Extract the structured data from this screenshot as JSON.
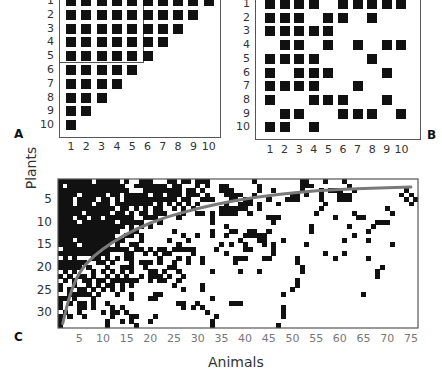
{
  "chart_data": [
    {
      "panel": "A",
      "type": "heatmap",
      "title": "",
      "xlabel": "",
      "ylabel": "",
      "x_ticks": [
        "1",
        "2",
        "3",
        "4",
        "5",
        "6",
        "7",
        "8",
        "9",
        "10"
      ],
      "y_ticks": [
        "1",
        "2",
        "3",
        "4",
        "5",
        "6",
        "7",
        "8",
        "9",
        "10"
      ],
      "description": "Perfectly nested interaction matrix; inner box highlights rows 1-5 x columns 1-5",
      "matrix_rows": [
        [
          1,
          2,
          3,
          4,
          5,
          6,
          7,
          8,
          9,
          10
        ],
        [
          1,
          2,
          3,
          4,
          5,
          6,
          7,
          8,
          9
        ],
        [
          1,
          2,
          3,
          4,
          5,
          6,
          7,
          8
        ],
        [
          1,
          2,
          3,
          4,
          5,
          6,
          7
        ],
        [
          1,
          2,
          3,
          4,
          5,
          6
        ],
        [
          1,
          2,
          3,
          4,
          5
        ],
        [
          1,
          2,
          3,
          4
        ],
        [
          1,
          2,
          3
        ],
        [
          1,
          2
        ],
        [
          1
        ]
      ],
      "highlight_box": {
        "rows": [
          1,
          5
        ],
        "cols": [
          1,
          5
        ]
      }
    },
    {
      "panel": "B",
      "type": "heatmap",
      "title": "",
      "x_ticks": [
        "1",
        "2",
        "3",
        "4",
        "5",
        "6",
        "7",
        "8",
        "9",
        "10"
      ],
      "y_ticks": [
        "1",
        "2",
        "3",
        "4",
        "5",
        "6",
        "7",
        "8",
        "9",
        "10"
      ],
      "description": "Random (non-nested) interaction matrix",
      "matrix_rows": [
        [
          1,
          2,
          3,
          4,
          6,
          7,
          8,
          9,
          10
        ],
        [
          1,
          2,
          3,
          5,
          6,
          8
        ],
        [
          1,
          2,
          3,
          4,
          5
        ],
        [
          2,
          3,
          5,
          7,
          9,
          10
        ],
        [
          1,
          2,
          3,
          4,
          8
        ],
        [
          1,
          3,
          4,
          5,
          9
        ],
        [
          1,
          2,
          3,
          4,
          7
        ],
        [
          1,
          4,
          5,
          6,
          9
        ],
        [
          2,
          3,
          6,
          7,
          8,
          10
        ],
        [
          1,
          2,
          4
        ]
      ]
    },
    {
      "panel": "C",
      "type": "heatmap",
      "xlabel": "Animals",
      "ylabel": "Plants",
      "x_ticks": [
        "5",
        "10",
        "15",
        "20",
        "25",
        "30",
        "35",
        "40",
        "45",
        "50",
        "55",
        "60",
        "65",
        "70",
        "75"
      ],
      "y_ticks": [
        "5",
        "10",
        "15",
        "20",
        "25",
        "30"
      ],
      "n_cols": 76,
      "n_rows": 33,
      "description": "Empirical plant-animal interaction matrix with isocline of perfect nestedness",
      "isocline_color": "#777777",
      "isocline_points": [
        [
          1.5,
          32.5
        ],
        [
          3,
          26
        ],
        [
          5,
          21
        ],
        [
          8,
          17.5
        ],
        [
          12,
          14.5
        ],
        [
          17,
          11.5
        ],
        [
          23,
          9
        ],
        [
          30,
          7
        ],
        [
          38,
          5.2
        ],
        [
          46,
          4
        ],
        [
          55,
          3.1
        ],
        [
          65,
          2.6
        ],
        [
          75,
          2.3
        ]
      ],
      "matrix_rows": [
        [
          1,
          2,
          3,
          4,
          5,
          6,
          7,
          9,
          10,
          11,
          12,
          13,
          15,
          18,
          19,
          20,
          24,
          25,
          27,
          28,
          30,
          31,
          32,
          42,
          52,
          53,
          57,
          61
        ],
        [
          1,
          3,
          4,
          5,
          6,
          7,
          8,
          9,
          10,
          11,
          12,
          13,
          14,
          17,
          18,
          19,
          20,
          21,
          22,
          23,
          25,
          26,
          30,
          32,
          35,
          36,
          43,
          52,
          53,
          54,
          62
        ],
        [
          1,
          2,
          3,
          4,
          5,
          6,
          7,
          8,
          9,
          10,
          11,
          12,
          13,
          14,
          15,
          19,
          20,
          21,
          22,
          23,
          24,
          25,
          26,
          28,
          29,
          31,
          35,
          36,
          37,
          43,
          46,
          52,
          56,
          58,
          59,
          60,
          63,
          74
        ],
        [
          1,
          2,
          3,
          4,
          6,
          7,
          8,
          9,
          10,
          12,
          13,
          15,
          16,
          17,
          18,
          19,
          21,
          22,
          24,
          25,
          26,
          28,
          29,
          30,
          32,
          36,
          37,
          38,
          39,
          42,
          50,
          51,
          53,
          56,
          60,
          61,
          62,
          73,
          75
        ],
        [
          1,
          2,
          3,
          5,
          6,
          7,
          8,
          10,
          11,
          13,
          15,
          16,
          17,
          18,
          19,
          20,
          21,
          22,
          23,
          24,
          25,
          27,
          28,
          31,
          32,
          33,
          37,
          38,
          40,
          41,
          45,
          49,
          50,
          51,
          56,
          60,
          61,
          62,
          74,
          76
        ],
        [
          1,
          2,
          3,
          5,
          6,
          7,
          9,
          10,
          11,
          13,
          14,
          15,
          16,
          17,
          18,
          19,
          20,
          22,
          24,
          26,
          28,
          30,
          36,
          39,
          40,
          41,
          43,
          47,
          57,
          75
        ],
        [
          1,
          2,
          3,
          4,
          5,
          6,
          7,
          8,
          9,
          10,
          11,
          12,
          14,
          15,
          17,
          19,
          21,
          22,
          25,
          27,
          29,
          35,
          36,
          37,
          38,
          39,
          40,
          43,
          56,
          70
        ],
        [
          1,
          2,
          3,
          4,
          5,
          7,
          8,
          9,
          10,
          11,
          13,
          14,
          16,
          18,
          19,
          21,
          22,
          23,
          27,
          30,
          31,
          33,
          35,
          36,
          37,
          38,
          41,
          55,
          63,
          71
        ],
        [
          1,
          2,
          3,
          5,
          6,
          8,
          9,
          11,
          12,
          13,
          14,
          15,
          16,
          19,
          20,
          21,
          26,
          33,
          45,
          46,
          47,
          59,
          64,
          65
        ],
        [
          1,
          2,
          3,
          4,
          6,
          7,
          8,
          9,
          10,
          11,
          12,
          14,
          15,
          16,
          17,
          18,
          22,
          33,
          46,
          68,
          69,
          70
        ],
        [
          1,
          2,
          3,
          4,
          5,
          6,
          7,
          8,
          9,
          10,
          11,
          12,
          13,
          14,
          16,
          18,
          20,
          36,
          54,
          62,
          67
        ],
        [
          1,
          2,
          3,
          4,
          5,
          6,
          7,
          8,
          9,
          10,
          11,
          12,
          13,
          16,
          17,
          25,
          33,
          37,
          38,
          41,
          42,
          45,
          54,
          66
        ],
        [
          1,
          2,
          3,
          4,
          5,
          6,
          7,
          8,
          9,
          10,
          11,
          12,
          15,
          16,
          18,
          27,
          30,
          33,
          36,
          40,
          41,
          42,
          43,
          44,
          63
        ],
        [
          1,
          2,
          3,
          5,
          6,
          7,
          8,
          9,
          10,
          11,
          12,
          13,
          14,
          18,
          24,
          28,
          39,
          43,
          44,
          48,
          61,
          66
        ],
        [
          1,
          2,
          3,
          4,
          6,
          7,
          8,
          9,
          10,
          11,
          13,
          16,
          17,
          26,
          35,
          37,
          40,
          44,
          46,
          53,
          71
        ],
        [
          2,
          3,
          4,
          5,
          6,
          7,
          8,
          9,
          10,
          11,
          12,
          13,
          14,
          15,
          17,
          18,
          20,
          22,
          23,
          25,
          26,
          27,
          28,
          29,
          34,
          40,
          41,
          46
        ],
        [
          1,
          2,
          3,
          4,
          5,
          6,
          7,
          8,
          9,
          10,
          11,
          15,
          16,
          19,
          21,
          23,
          24,
          29,
          36,
          46,
          57,
          61
        ],
        [
          2,
          4,
          8,
          9,
          11,
          13,
          15,
          16,
          22,
          26,
          28,
          31,
          38,
          39,
          40,
          44,
          45,
          51,
          59,
          66
        ],
        [
          1,
          2,
          3,
          4,
          5,
          6,
          9,
          10,
          12,
          16,
          18,
          19,
          20,
          22,
          25,
          28,
          31,
          38,
          51
        ],
        [
          1,
          2,
          3,
          4,
          5,
          7,
          11,
          14,
          15,
          16,
          19,
          24,
          25,
          52,
          69
        ],
        [
          2,
          4,
          8,
          10,
          12,
          14,
          16,
          20,
          21,
          23,
          26,
          33,
          39,
          43,
          52,
          68
        ],
        [
          1,
          3,
          5,
          6,
          8,
          11,
          13,
          15,
          18,
          20,
          21,
          22,
          24,
          27,
          68
        ],
        [
          2,
          4,
          6,
          7,
          9,
          10,
          12,
          13,
          14,
          15,
          16,
          17,
          20,
          22,
          23,
          26,
          51
        ],
        [
          1,
          4,
          7,
          9,
          11,
          12,
          14,
          16,
          25,
          31,
          51
        ],
        [
          1,
          3,
          5,
          6,
          8,
          10,
          12,
          14,
          27,
          31,
          50
        ],
        [
          3,
          4,
          5,
          6,
          7,
          9,
          13,
          16,
          21,
          22,
          48,
          65
        ],
        [
          1,
          2,
          4,
          8,
          16,
          20,
          21,
          33
        ],
        [
          1,
          3,
          5,
          6,
          8,
          11,
          26,
          27,
          30,
          37,
          38,
          39
        ],
        [
          1,
          5,
          6,
          8,
          12,
          14,
          27,
          29,
          31,
          48
        ],
        [
          2,
          5,
          10,
          12,
          13,
          15,
          32,
          48
        ],
        [
          1,
          3,
          6,
          12,
          16,
          17,
          21,
          34,
          48
        ],
        [
          1,
          11,
          14,
          16,
          20,
          33
        ],
        [
          1,
          11,
          17,
          33,
          47
        ]
      ]
    }
  ],
  "labels": {
    "panel_a": "A",
    "panel_b": "B",
    "panel_c": "C",
    "x_title": "Animals",
    "y_title": "Plants"
  },
  "ticks": {
    "a_rows": [
      "1",
      "2",
      "3",
      "4",
      "5",
      "6",
      "7",
      "8",
      "9",
      "10"
    ],
    "a_cols": [
      "1",
      "2",
      "3",
      "4",
      "5",
      "6",
      "7",
      "8",
      "9",
      "10"
    ],
    "b_rows": [
      "1",
      "2",
      "3",
      "4",
      "5",
      "6",
      "7",
      "8",
      "9",
      "10"
    ],
    "b_cols": [
      "1",
      "2",
      "3",
      "4",
      "5",
      "6",
      "7",
      "8",
      "9",
      "10"
    ],
    "c_rows": [
      "5",
      "10",
      "15",
      "20",
      "25",
      "30"
    ],
    "c_cols": [
      "5",
      "10",
      "15",
      "20",
      "25",
      "30",
      "35",
      "40",
      "45",
      "50",
      "55",
      "60",
      "65",
      "70",
      "75"
    ]
  }
}
